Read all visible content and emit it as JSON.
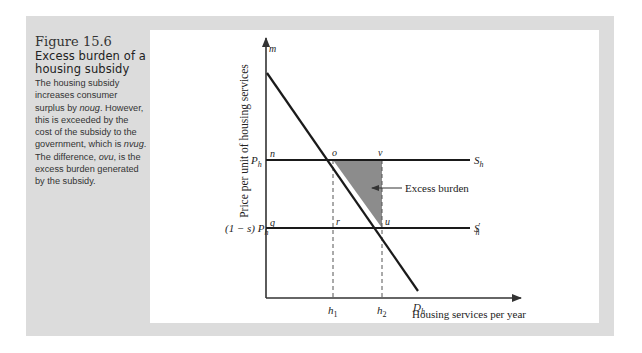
{
  "caption": {
    "figure_number": "Figure 15.6",
    "title": "Excess burden of a housing subsidy",
    "description_parts": [
      {
        "text": "The housing subsidy increases consumer surplus by ",
        "italic": false
      },
      {
        "text": "noug",
        "italic": true
      },
      {
        "text": ". However, this is exceeded by the cost of the subsidy to the government, which is ",
        "italic": false
      },
      {
        "text": "nvug",
        "italic": true
      },
      {
        "text": ". The difference, ",
        "italic": false
      },
      {
        "text": "ovu",
        "italic": true
      },
      {
        "text": ", is the excess burden generated by the subsidy.",
        "italic": false
      }
    ]
  },
  "diagram": {
    "y_axis_label": "Price per unit of housing services",
    "x_axis_label": "Housing services per year",
    "y_ticks": {
      "ph": "P",
      "ph_sub": "h",
      "ph_subsidized_prefix": "(1 − s) P",
      "ph_subsidized_sub": "h"
    },
    "x_ticks": {
      "h1": "h",
      "h1_sub": "1",
      "h2": "h",
      "h2_sub": "2"
    },
    "points": {
      "m": "m",
      "n": "n",
      "o": "o",
      "v": "v",
      "q": "q",
      "r": "r",
      "u": "u"
    },
    "curves": {
      "supply": "S",
      "supply_sub": "h",
      "supply_subsidized": "S",
      "supply_subsidized_sub": "h",
      "supply_subsidized_prime": "′",
      "demand": "D",
      "demand_sub": "h"
    },
    "annotation": "Excess burden",
    "colors": {
      "shaded_area": "#8c8c8c",
      "lines": "#1a1a1a",
      "axes": "#333333",
      "outer_background": "#dcdcdc"
    }
  }
}
